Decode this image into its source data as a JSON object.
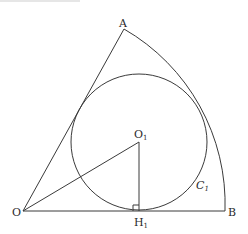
{
  "figure": {
    "type": "geometry-diagram",
    "points": {
      "O": {
        "label": "O",
        "x": 23,
        "y": 211
      },
      "A": {
        "label": "A",
        "x": 124,
        "y": 29
      },
      "B": {
        "label": "B",
        "x": 225,
        "y": 211
      },
      "O1": {
        "label": "O",
        "sub": "1",
        "x": 139,
        "y": 142
      },
      "H1": {
        "label": "H",
        "sub": "1",
        "x": 139,
        "y": 211
      }
    },
    "circle": {
      "name_main": "C",
      "name_sub": "1",
      "cx": 139,
      "cy": 142,
      "r": 68
    },
    "arc": {
      "center": "O",
      "radius": 202,
      "from": "A",
      "to": "B"
    },
    "segments": [
      {
        "from": "O",
        "to": "A"
      },
      {
        "from": "O",
        "to": "B"
      },
      {
        "from": "O",
        "to": "O1"
      },
      {
        "from": "O1",
        "to": "H1"
      }
    ],
    "right_angle_marker": {
      "at": "H1",
      "size": 6
    },
    "colors": {
      "stroke": "#3a3a3a",
      "text": "#2a2a2a",
      "background": "#ffffff"
    }
  }
}
